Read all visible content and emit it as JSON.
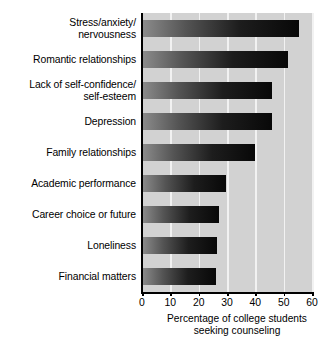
{
  "chart_data": {
    "type": "bar",
    "orientation": "horizontal",
    "title": "",
    "subtitle": "",
    "xlabel": "Percentage of college students\nseeking counseling",
    "ylabel": "",
    "xlim": [
      0,
      60
    ],
    "xticks": [
      0,
      10,
      20,
      30,
      40,
      50,
      60
    ],
    "xtick_labels": [
      "0",
      "10",
      "20",
      "30",
      "40",
      "50",
      "60"
    ],
    "grid": true,
    "grid_axis": "x",
    "legend": false,
    "legend_position": "none",
    "categories": [
      "Stress/anxiety/\nnervousness",
      "Romantic relationships",
      "Lack of self-confidence/\nself-esteem",
      "Depression",
      "Family relationships",
      "Academic performance",
      "Career choice or future",
      "Loneliness",
      "Financial matters"
    ],
    "values": [
      55.5,
      51.5,
      46,
      46,
      40,
      29.5,
      27,
      26.5,
      26
    ],
    "series": [
      {
        "name": "Percentage of college students seeking counseling",
        "values": [
          55.5,
          51.5,
          46,
          46,
          40,
          29.5,
          27,
          26.5,
          26
        ]
      }
    ],
    "bar_fill": "gradient-gray-to-black",
    "plot_background": "#d2d2d2",
    "gridline_color": "#f2f2f2",
    "axis_color": "#000000",
    "page_background": "#ffffff"
  }
}
